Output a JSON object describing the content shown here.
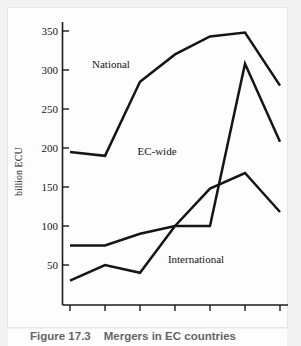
{
  "figure": {
    "caption_number": "Figure 17.3",
    "caption_title": "Mergers in EC countries"
  },
  "chart_data": {
    "type": "line",
    "title": "Mergers in EC countries",
    "xlabel": "",
    "ylabel": "billion ECU",
    "categories": [
      "1985",
      "86",
      "87",
      "88",
      "89",
      "90",
      "91"
    ],
    "xticklabels": [
      "1985",
      "86",
      "87",
      "88",
      "89",
      "90",
      "91"
    ],
    "yticklabels": [
      "50",
      "100",
      "150",
      "200",
      "250",
      "300",
      "350"
    ],
    "yticks": [
      50,
      100,
      150,
      200,
      250,
      300,
      350
    ],
    "ylim": [
      0,
      365
    ],
    "grid": false,
    "legend_position": "inline-annotations",
    "series": [
      {
        "name": "National",
        "values": [
          195,
          190,
          285,
          320,
          343,
          348,
          280
        ],
        "label": "National"
      },
      {
        "name": "EC-wide",
        "values": [
          75,
          75,
          90,
          100,
          100,
          308,
          208
        ],
        "label": "EC-wide"
      },
      {
        "name": "International",
        "values": [
          30,
          50,
          40,
          100,
          148,
          168,
          118
        ],
        "label": "International"
      }
    ],
    "annotations": [
      {
        "text": "National",
        "x": "86-87",
        "y": 318
      },
      {
        "text": "EC-wide",
        "x": "87-88",
        "y": 205
      },
      {
        "text": "International",
        "x": "89",
        "y": 78
      }
    ]
  },
  "colors": {
    "line": "#151515",
    "axis": "#1b1b1b",
    "paper": "#fdfdfd",
    "scan_margin": "#ececed"
  }
}
